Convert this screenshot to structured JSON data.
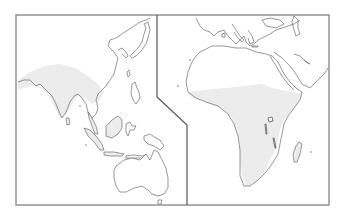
{
  "map": {
    "type": "distribution-range-map",
    "panels": [
      {
        "name": "asia-australia",
        "regions_shown": [
          "South Asia",
          "East Asia",
          "Southeast Asia",
          "Australia"
        ]
      },
      {
        "name": "europe-africa",
        "regions_shown": [
          "Europe (south)",
          "Middle East",
          "Africa",
          "Madagascar"
        ]
      }
    ],
    "colors": {
      "frame": "#8a8a8a",
      "divider": "#555555",
      "coastline": "#6b6b6b",
      "range_fill": "#ececec",
      "land_fill": "#ffffff",
      "background": "#ffffff"
    },
    "shaded_range": [
      "sub-Saharan Africa",
      "Madagascar",
      "Indian subcontinent",
      "Southeast Asia",
      "Borneo"
    ]
  }
}
